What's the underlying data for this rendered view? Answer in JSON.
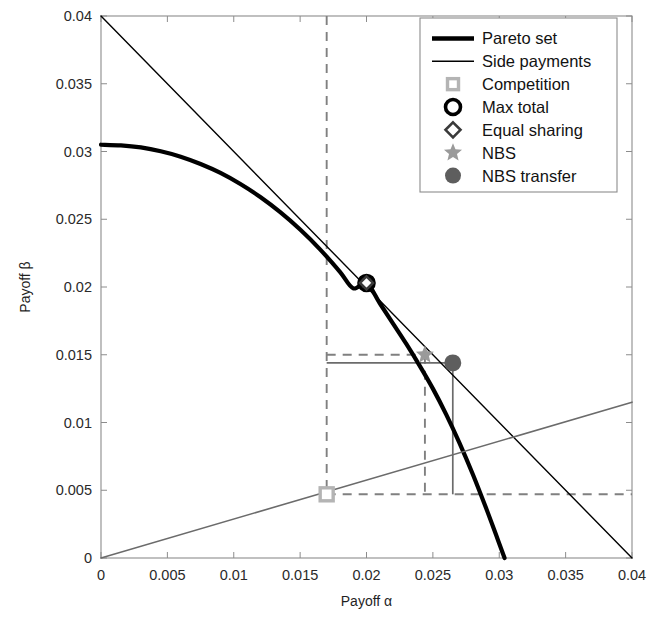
{
  "figure": {
    "background": "#ffffff",
    "plot_box": {
      "left": 101,
      "top": 16,
      "right": 632,
      "bottom": 558
    },
    "frame_color": "#8c8c8c"
  },
  "axes": {
    "x": {
      "title": "Payoff α",
      "min": 0,
      "max": 0.04,
      "ticks": [
        0,
        0.005,
        0.01,
        0.015,
        0.02,
        0.025,
        0.03,
        0.035,
        0.04
      ],
      "tick_labels": [
        "0",
        "0.005",
        "0.01",
        "0.015",
        "0.02",
        "0.025",
        "0.03",
        "0.035",
        "0.04"
      ]
    },
    "y": {
      "title": "Payoff β",
      "min": 0,
      "max": 0.04,
      "ticks": [
        0,
        0.005,
        0.01,
        0.015,
        0.02,
        0.025,
        0.03,
        0.035,
        0.04
      ],
      "tick_labels": [
        "0",
        "0.005",
        "0.01",
        "0.015",
        "0.02",
        "0.025",
        "0.03",
        "0.035",
        "0.04"
      ]
    }
  },
  "legend": {
    "position": "top-right",
    "box": {
      "left": 420,
      "top": 18,
      "width": 197,
      "height": 174
    },
    "border_color": "#8c8c8c",
    "items": [
      {
        "label": "Pareto set",
        "marker": "thick-line",
        "color": "#000000"
      },
      {
        "label": "Side payments",
        "marker": "thin-line",
        "color": "#000000"
      },
      {
        "label": "Competition",
        "marker": "open-square",
        "color": "#b4b4b4"
      },
      {
        "label": "Max total",
        "marker": "open-circle",
        "color": "#000000"
      },
      {
        "label": "Equal sharing",
        "marker": "open-diamond",
        "color": "#3a3a3a"
      },
      {
        "label": "NBS",
        "marker": "filled-star",
        "color": "#9a9a9a"
      },
      {
        "label": "NBS transfer",
        "marker": "filled-circle",
        "color": "#5e5e5e"
      }
    ]
  },
  "chart_data": {
    "type": "line",
    "title": "",
    "xlabel": "Payoff α",
    "ylabel": "Payoff β",
    "xlim": [
      0,
      0.04
    ],
    "ylim": [
      0,
      0.04
    ],
    "grid": false,
    "legend_position": "top-right",
    "series": [
      {
        "name": "Pareto set",
        "type": "line",
        "style": "solid",
        "color": "#000000",
        "line_width": 4.2,
        "comment": "concave frontier from (0, 0.0305) to (0.0304, 0)",
        "points": [
          [
            0.0,
            0.0305
          ],
          [
            0.0015,
            0.03045
          ],
          [
            0.003,
            0.0303
          ],
          [
            0.0045,
            0.03002
          ],
          [
            0.006,
            0.02962
          ],
          [
            0.0075,
            0.02908
          ],
          [
            0.009,
            0.02842
          ],
          [
            0.0105,
            0.0276
          ],
          [
            0.012,
            0.02664
          ],
          [
            0.0135,
            0.02552
          ],
          [
            0.015,
            0.02424
          ],
          [
            0.0165,
            0.02278
          ],
          [
            0.018,
            0.02112
          ],
          [
            0.019,
            0.0199
          ],
          [
            0.02,
            0.0203
          ],
          [
            0.021,
            0.0188
          ],
          [
            0.022,
            0.0173
          ],
          [
            0.023,
            0.0158
          ],
          [
            0.024,
            0.0142
          ],
          [
            0.025,
            0.0125
          ],
          [
            0.026,
            0.0106
          ],
          [
            0.027,
            0.0085
          ],
          [
            0.028,
            0.0062
          ],
          [
            0.029,
            0.0037
          ],
          [
            0.0298,
            0.0016
          ],
          [
            0.0304,
            0.0
          ]
        ]
      },
      {
        "name": "Side payments",
        "type": "line",
        "style": "solid",
        "color": "#000000",
        "line_width": 1.4,
        "points": [
          [
            0.0,
            0.04
          ],
          [
            0.04,
            0.0
          ]
        ]
      },
      {
        "name": "Equal sharing ray",
        "type": "line",
        "style": "solid",
        "color": "#6b6b6b",
        "line_width": 1.6,
        "points": [
          [
            0.0,
            0.0
          ],
          [
            0.04,
            0.0115
          ]
        ]
      }
    ],
    "guides": [
      {
        "name": "competition-vertical",
        "style": "dashed",
        "color": "#808080",
        "points": [
          [
            0.017,
            0.04
          ],
          [
            0.017,
            0.0047
          ]
        ]
      },
      {
        "name": "competition-horizontal",
        "style": "dashed",
        "color": "#808080",
        "points": [
          [
            0.017,
            0.0047
          ],
          [
            0.04,
            0.0047
          ]
        ]
      },
      {
        "name": "nbs-vertical",
        "style": "dashed",
        "color": "#808080",
        "points": [
          [
            0.0244,
            0.015
          ],
          [
            0.0244,
            0.0047
          ]
        ]
      },
      {
        "name": "nbs-horizontal",
        "style": "dashed",
        "color": "#808080",
        "points": [
          [
            0.017,
            0.015
          ],
          [
            0.0244,
            0.015
          ]
        ]
      },
      {
        "name": "transfer-horizontal",
        "style": "solid",
        "color": "#6b6b6b",
        "points": [
          [
            0.017,
            0.0144
          ],
          [
            0.0265,
            0.0144
          ]
        ]
      },
      {
        "name": "transfer-vertical",
        "style": "solid",
        "color": "#6b6b6b",
        "points": [
          [
            0.0265,
            0.0144
          ],
          [
            0.0265,
            0.0047
          ]
        ]
      }
    ],
    "markers": [
      {
        "name": "Competition",
        "x": 0.017,
        "y": 0.0047,
        "shape": "open-square",
        "color": "#b4b4b4",
        "size": 13
      },
      {
        "name": "Max total",
        "x": 0.02,
        "y": 0.0203,
        "shape": "open-circle",
        "color": "#000000",
        "size": 15
      },
      {
        "name": "Equal sharing",
        "x": 0.02,
        "y": 0.0203,
        "shape": "open-diamond",
        "color": "#3a3a3a",
        "size": 13
      },
      {
        "name": "NBS",
        "x": 0.0244,
        "y": 0.015,
        "shape": "filled-star",
        "color": "#9a9a9a",
        "size": 19
      },
      {
        "name": "NBS transfer",
        "x": 0.0265,
        "y": 0.0144,
        "shape": "filled-circle",
        "color": "#5e5e5e",
        "size": 17
      }
    ]
  },
  "caption_fragment": {
    "text": ""
  }
}
